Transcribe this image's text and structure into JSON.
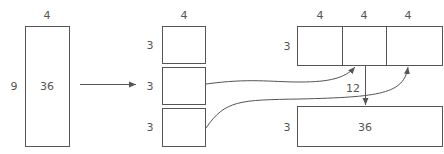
{
  "diagram": {
    "source": {
      "width_label": "4",
      "height_label": "9",
      "value": "36"
    },
    "split": {
      "width_label": "4",
      "rows": [
        {
          "height_label": "3"
        },
        {
          "height_label": "3"
        },
        {
          "height_label": "3"
        }
      ]
    },
    "concat_row": {
      "height_label": "3",
      "column_labels": [
        "4",
        "4",
        "4"
      ]
    },
    "edge_label": "12",
    "result": {
      "height_label": "3",
      "value": "36"
    },
    "colors": {
      "stroke": "#555555",
      "text": "#555555",
      "background": "#ffffff"
    }
  }
}
